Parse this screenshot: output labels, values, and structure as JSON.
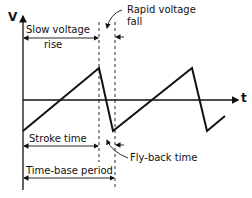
{
  "diagram": {
    "type": "sawtooth-timebase-waveform",
    "axes": {
      "y_label": "V",
      "x_label": "t"
    },
    "labels": {
      "slow_rise_line1": "Slow voltage",
      "slow_rise_line2": "rise",
      "rapid_fall_line1": "Rapid voltage",
      "rapid_fall_line2": "fall",
      "stroke_time": "Stroke time",
      "flyback_time": "Fly-back time",
      "timebase_period": "Time-base period"
    },
    "colors": {
      "line": "#111111",
      "background": "#ffffff"
    }
  }
}
